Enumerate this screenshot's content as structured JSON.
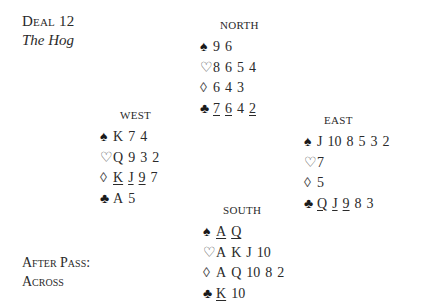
{
  "header": {
    "title": "Deal 12",
    "subtitle": "The Hog"
  },
  "footer": {
    "line1": "After Pass:",
    "line2": "Across"
  },
  "suit_icons": {
    "spade": "♠",
    "heart": "♡",
    "diamond": "◊",
    "club": "♣"
  },
  "hands": {
    "north": {
      "label": "NORTH",
      "spades": [
        {
          "r": "9",
          "u": false
        },
        {
          "r": "6",
          "u": false
        }
      ],
      "hearts": [
        {
          "r": "8",
          "u": false
        },
        {
          "r": "6",
          "u": false
        },
        {
          "r": "5",
          "u": false
        },
        {
          "r": "4",
          "u": false
        }
      ],
      "diamonds": [
        {
          "r": "6",
          "u": false
        },
        {
          "r": "4",
          "u": false
        },
        {
          "r": "3",
          "u": false
        }
      ],
      "clubs": [
        {
          "r": "7",
          "u": true
        },
        {
          "r": "6",
          "u": true
        },
        {
          "r": "4",
          "u": false
        },
        {
          "r": "2",
          "u": true
        }
      ]
    },
    "west": {
      "label": "WEST",
      "spades": [
        {
          "r": "K",
          "u": false
        },
        {
          "r": "7",
          "u": false
        },
        {
          "r": "4",
          "u": false
        }
      ],
      "hearts": [
        {
          "r": "Q",
          "u": false
        },
        {
          "r": "9",
          "u": false
        },
        {
          "r": "3",
          "u": false
        },
        {
          "r": "2",
          "u": false
        }
      ],
      "diamonds": [
        {
          "r": "K",
          "u": true
        },
        {
          "r": "J",
          "u": true
        },
        {
          "r": "9",
          "u": true
        },
        {
          "r": "7",
          "u": false
        }
      ],
      "clubs": [
        {
          "r": "A",
          "u": false
        },
        {
          "r": "5",
          "u": false
        }
      ]
    },
    "east": {
      "label": "EAST",
      "spades": [
        {
          "r": "J",
          "u": false
        },
        {
          "r": "10",
          "u": false
        },
        {
          "r": "8",
          "u": false
        },
        {
          "r": "5",
          "u": false
        },
        {
          "r": "3",
          "u": false
        },
        {
          "r": "2",
          "u": false
        }
      ],
      "hearts": [
        {
          "r": "7",
          "u": false
        }
      ],
      "diamonds": [
        {
          "r": "5",
          "u": false
        }
      ],
      "clubs": [
        {
          "r": "Q",
          "u": true
        },
        {
          "r": "J",
          "u": true
        },
        {
          "r": "9",
          "u": true
        },
        {
          "r": "8",
          "u": false
        },
        {
          "r": "3",
          "u": false
        }
      ]
    },
    "south": {
      "label": "SOUTH",
      "spades": [
        {
          "r": "A",
          "u": true
        },
        {
          "r": "Q",
          "u": true
        }
      ],
      "hearts": [
        {
          "r": "A",
          "u": false
        },
        {
          "r": "K",
          "u": false
        },
        {
          "r": "J",
          "u": false
        },
        {
          "r": "10",
          "u": false
        }
      ],
      "diamonds": [
        {
          "r": "A",
          "u": false
        },
        {
          "r": "Q",
          "u": false
        },
        {
          "r": "10",
          "u": false
        },
        {
          "r": "8",
          "u": false
        },
        {
          "r": "2",
          "u": false
        }
      ],
      "clubs": [
        {
          "r": "K",
          "u": true
        },
        {
          "r": "10",
          "u": false
        }
      ]
    }
  }
}
